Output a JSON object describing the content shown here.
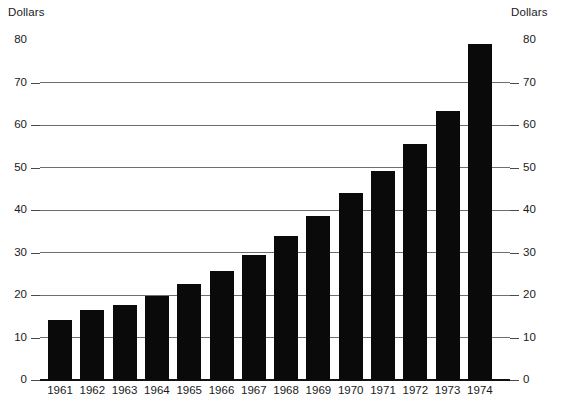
{
  "axis": {
    "left_unit_label": "Dollars",
    "right_unit_label": "Dollars"
  },
  "chart_data": {
    "type": "bar",
    "title": "",
    "xlabel": "",
    "ylabel": "Dollars",
    "y2label": "Dollars",
    "ylim": [
      0,
      80
    ],
    "yticks": [
      0,
      10,
      20,
      30,
      40,
      50,
      60,
      70,
      80
    ],
    "ytick_labels": [
      "0",
      "10",
      "20",
      "30",
      "40",
      "50",
      "60",
      "70",
      "80"
    ],
    "grid": true,
    "legend": "none",
    "bar_color": "#0a0a0a",
    "categories": [
      "1961",
      "1962",
      "1963",
      "1964",
      "1965",
      "1966",
      "1967",
      "1968",
      "1969",
      "1970",
      "1971",
      "1972",
      "1973",
      "1974"
    ],
    "values": [
      14.2,
      16.5,
      17.7,
      19.8,
      22.5,
      25.7,
      29.5,
      33.8,
      38.6,
      44.0,
      49.2,
      55.5,
      63.2,
      79.0
    ]
  }
}
